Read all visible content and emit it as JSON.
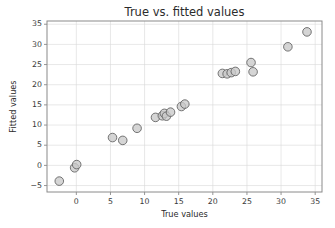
{
  "chart_data": {
    "type": "scatter",
    "title": "True vs. fitted values",
    "xlabel": "True values",
    "ylabel": "Fitted values",
    "xlim": [
      -4.3,
      36.0
    ],
    "ylim": [
      -6.6,
      35.8
    ],
    "xticks": [
      0,
      5,
      10,
      15,
      20,
      25,
      30,
      35
    ],
    "yticks": [
      -5,
      0,
      5,
      10,
      15,
      20,
      25,
      30,
      35
    ],
    "xticklabels": [
      "0",
      "5",
      "10",
      "15",
      "20",
      "25",
      "30",
      "35"
    ],
    "yticklabels": [
      "−5",
      "0",
      "5",
      "10",
      "15",
      "20",
      "25",
      "30",
      "35"
    ],
    "grid": true,
    "legend": null,
    "marker": {
      "shape": "circle",
      "facecolor": "#c9c9c9",
      "edgecolor": "#5e5e5e",
      "alpha": 0.78,
      "size": 4.3
    },
    "points": [
      {
        "x": -2.5,
        "y": -3.9
      },
      {
        "x": -0.25,
        "y": -0.6
      },
      {
        "x": 0.05,
        "y": 0.2
      },
      {
        "x": 5.3,
        "y": 6.9
      },
      {
        "x": 6.8,
        "y": 6.2
      },
      {
        "x": 8.9,
        "y": 9.2
      },
      {
        "x": 11.6,
        "y": 11.9
      },
      {
        "x": 12.6,
        "y": 12.3
      },
      {
        "x": 12.9,
        "y": 12.9
      },
      {
        "x": 13.2,
        "y": 12.2
      },
      {
        "x": 13.8,
        "y": 13.2
      },
      {
        "x": 15.4,
        "y": 14.6
      },
      {
        "x": 15.9,
        "y": 15.2
      },
      {
        "x": 21.4,
        "y": 22.8
      },
      {
        "x": 22.1,
        "y": 22.7
      },
      {
        "x": 22.7,
        "y": 23.0
      },
      {
        "x": 23.3,
        "y": 23.3
      },
      {
        "x": 25.6,
        "y": 25.5
      },
      {
        "x": 25.9,
        "y": 23.2
      },
      {
        "x": 31.0,
        "y": 29.4
      },
      {
        "x": 33.8,
        "y": 33.1
      }
    ]
  },
  "colors": {
    "background": "#ffffff",
    "grid": "#d9d9d9",
    "spine": "#8a8a8a",
    "text": "#2b2b2b",
    "marker_face": "#c9c9c9",
    "marker_edge": "#5e5e5e"
  }
}
